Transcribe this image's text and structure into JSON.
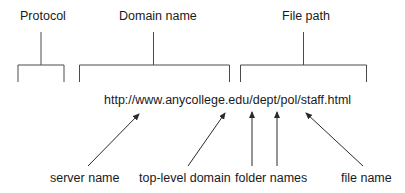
{
  "diagram": {
    "title_labels": {
      "protocol": "Protocol",
      "domain_name": "Domain name",
      "file_path": "File path"
    },
    "url": "http://www.anycollege.edu/dept/pol/staff.html",
    "bottom_labels": {
      "server_name": "server name",
      "top_level_domain": "top-level domain",
      "folder_names": "folder names",
      "file_name": "file name"
    },
    "colors": {
      "line": "#3a3a3a",
      "text": "#1a1a1a",
      "background": "#ffffff"
    }
  }
}
